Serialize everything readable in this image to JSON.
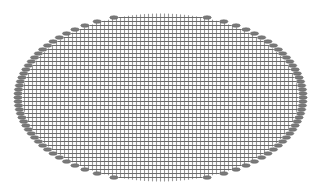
{
  "diagram": {
    "title": "",
    "type": "elliptical-grid-mesh",
    "ellipse": {
      "cx": 160.5,
      "cy": 97.5,
      "rx": 138,
      "ry": 84
    },
    "grid_spacing": 4,
    "marker": {
      "shape": "ellipse",
      "rx": 4.2,
      "ry": 1.8,
      "offset": 4.5
    },
    "colors": {
      "background": "#ffffff",
      "horizontal_line": "#6a6a6a",
      "vertical_line": "#9a9a9a",
      "marker_fill": "#7a7a7a",
      "marker_stroke": "#5a5a5a"
    },
    "markers_every_n_rows": 1
  }
}
